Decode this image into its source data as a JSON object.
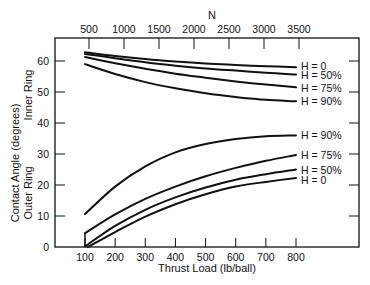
{
  "chart_data": {
    "type": "line",
    "title": "",
    "xlabel": "Thrust Load (lb/ball)",
    "x2label": "N",
    "ylabel": "Contact Angle (degrees)",
    "ylabel_inner": "Inner Ring",
    "ylabel_outer": "Outer Ring",
    "xlim": [
      0,
      900
    ],
    "ylim": [
      0,
      66
    ],
    "x_ticks": [
      100,
      200,
      300,
      400,
      500,
      600,
      700,
      800
    ],
    "x2_ticks": [
      500,
      1000,
      1500,
      2000,
      2500,
      3000,
      3500
    ],
    "y_ticks": [
      0,
      10,
      20,
      30,
      40,
      50,
      60
    ],
    "grid": false,
    "legend": "inline labels at right end of curves",
    "series": [
      {
        "group": "Inner Ring",
        "name": "H = 0",
        "x": [
          100,
          200,
          300,
          400,
          500,
          600,
          700,
          800
        ],
        "y": [
          62.8,
          61.6,
          60.6,
          59.8,
          59.2,
          58.7,
          58.3,
          58.0
        ]
      },
      {
        "group": "Inner Ring",
        "name": "H = 50%",
        "x": [
          100,
          200,
          300,
          400,
          500,
          600,
          700,
          800
        ],
        "y": [
          62.3,
          60.9,
          59.6,
          58.5,
          57.6,
          56.9,
          56.2,
          55.6
        ]
      },
      {
        "group": "Inner Ring",
        "name": "H = 75%",
        "x": [
          100,
          200,
          300,
          400,
          500,
          600,
          700,
          800
        ],
        "y": [
          61.3,
          59.3,
          57.5,
          55.9,
          54.6,
          53.4,
          52.4,
          51.5
        ]
      },
      {
        "group": "Inner Ring",
        "name": "H = 90%",
        "x": [
          100,
          200,
          300,
          400,
          500,
          600,
          700,
          800
        ],
        "y": [
          59.0,
          55.8,
          53.2,
          51.2,
          49.6,
          48.4,
          47.5,
          47.0
        ]
      },
      {
        "group": "Outer Ring",
        "name": "H = 90%",
        "x": [
          100,
          200,
          300,
          400,
          500,
          600,
          700,
          800
        ],
        "y": [
          10.6,
          19.5,
          26.0,
          30.5,
          33.2,
          34.8,
          35.7,
          36.0
        ]
      },
      {
        "group": "Outer Ring",
        "name": "H = 75%",
        "x": [
          100,
          200,
          300,
          400,
          500,
          600,
          700,
          800
        ],
        "y": [
          4.5,
          10.5,
          15.5,
          19.5,
          22.8,
          25.5,
          27.8,
          29.7
        ]
      },
      {
        "group": "Outer Ring",
        "name": "H = 50%",
        "x": [
          100,
          200,
          300,
          400,
          500,
          600,
          700,
          800
        ],
        "y": [
          0.2,
          6.8,
          12.0,
          16.0,
          19.2,
          21.7,
          23.5,
          25.0
        ]
      },
      {
        "group": "Outer Ring",
        "name": "H = 0",
        "x": [
          110,
          200,
          300,
          400,
          500,
          600,
          700,
          800
        ],
        "y": [
          0.0,
          4.8,
          9.8,
          13.8,
          17.0,
          19.5,
          21.0,
          22.3
        ]
      }
    ]
  },
  "plot_box": {
    "left": 55,
    "top": 38,
    "right": 359,
    "bottom": 247
  },
  "x_map": {
    "v0": 100,
    "px0": 85,
    "v1": 800,
    "px1": 296
  },
  "x2_map": {
    "v0": 500,
    "px0": 89,
    "v1": 3500,
    "px1": 299
  },
  "y_map": {
    "v0": 0,
    "px0": 247,
    "v1": 60,
    "px1": 61
  },
  "right_ticks_y": [
    0,
    10,
    20,
    30,
    40,
    50,
    60
  ]
}
